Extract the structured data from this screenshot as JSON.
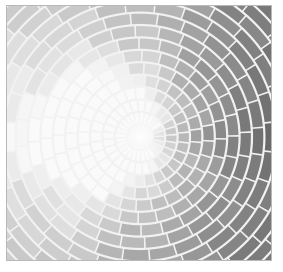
{
  "figure": {
    "kind": "radial-tile-mosaic",
    "title": "",
    "canvas": {
      "width": 283,
      "height": 272,
      "background": "#ffffff"
    },
    "plot_area": {
      "x": 6,
      "y": 5,
      "width": 266,
      "height": 256,
      "border_color": "#b8b8b8",
      "border_width": 1
    },
    "center": {
      "x": 140,
      "y": 137
    },
    "geometry": {
      "rings": 22,
      "ring_width": 12.4,
      "inner_radius": 1.5,
      "max_radius": 275,
      "sectors_base": 28,
      "stagger": true,
      "tile_gap_radial": 2.2,
      "tile_gap_angular_px": 1.6,
      "corner_radius": 1.6,
      "spiral_twist_deg_per_ring": 4.5
    },
    "grout": {
      "color": "#f2f2f2"
    },
    "shading": {
      "model": "angular-gradient",
      "description": "Tile lightness varies with polar angle; brightest toward the left/upper-left, darkest toward the right and upper-right.",
      "light_angle_deg": 190,
      "dark_angle_deg": 20,
      "min_gray": 82,
      "max_gray": 232,
      "radial_lightening": 0.18,
      "noise_amplitude": 7
    },
    "palette": {
      "lightest": "#e8e8e8",
      "light": "#cccccc",
      "mid": "#a0a0a0",
      "dark": "#6e6e6e",
      "darkest": "#525252",
      "grout": "#f4f4f4",
      "frame": "#b8b8b8",
      "page": "#ffffff"
    }
  },
  "chart_data": {
    "type": "heatmap",
    "title": "",
    "xlabel": "",
    "ylabel": "",
    "coordinate_system": "polar",
    "angle_ticks_deg": [
      0,
      45,
      90,
      135,
      180,
      225,
      270,
      315
    ],
    "angle_brightness": [
      96,
      118,
      150,
      196,
      228,
      205,
      168,
      120
    ],
    "ring_indices": [
      0,
      1,
      2,
      3,
      4,
      5,
      6,
      7,
      8,
      9,
      10,
      11,
      12,
      13,
      14,
      15,
      16,
      17,
      18,
      19,
      20,
      21
    ],
    "ring_radii": [
      1.5,
      13.9,
      26.3,
      38.7,
      51.1,
      63.5,
      75.9,
      88.3,
      100.7,
      113.1,
      125.5,
      137.9,
      150.3,
      162.7,
      175.1,
      187.5,
      199.9,
      212.3,
      224.7,
      237.1,
      249.5,
      261.9
    ],
    "tiles_per_ring": [
      28,
      28,
      28,
      28,
      28,
      28,
      28,
      28,
      28,
      28,
      28,
      28,
      28,
      28,
      28,
      28,
      28,
      28,
      28,
      28,
      28,
      28
    ],
    "value_range": [
      82,
      232
    ],
    "grid": false,
    "legend": false
  }
}
